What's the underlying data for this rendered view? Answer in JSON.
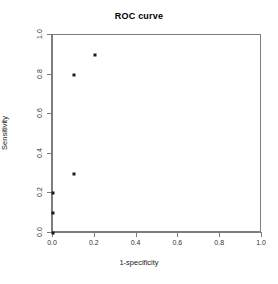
{
  "chart_data": {
    "type": "scatter",
    "title": "ROC curve",
    "xlabel": "1-specificity",
    "ylabel": "Sensitivity",
    "xlim": [
      0.0,
      1.0
    ],
    "ylim": [
      0.0,
      1.0
    ],
    "grid": false,
    "legend": null,
    "x_ticks": [
      "0.0",
      "0.2",
      "0.4",
      "0.6",
      "0.8",
      "1.0"
    ],
    "y_ticks": [
      "0.0",
      "0.2",
      "0.4",
      "0.6",
      "0.8",
      "1.0"
    ],
    "x_tick_values": [
      0.0,
      0.2,
      0.4,
      0.6,
      0.8,
      1.0
    ],
    "y_tick_values": [
      0.0,
      0.2,
      0.4,
      0.6,
      0.8,
      1.0
    ],
    "marker": "filled-square",
    "marker_color": "#1a1a1a",
    "points": [
      {
        "x": 0.0,
        "y": 0.0
      },
      {
        "x": 0.0,
        "y": 0.1
      },
      {
        "x": 0.0,
        "y": 0.2
      },
      {
        "x": 0.1,
        "y": 0.3
      },
      {
        "x": 0.1,
        "y": 0.8
      },
      {
        "x": 0.2,
        "y": 0.9
      }
    ],
    "x": [
      0.0,
      0.0,
      0.0,
      0.1,
      0.1,
      0.2
    ],
    "y": [
      0.0,
      0.1,
      0.2,
      0.3,
      0.8,
      0.9
    ]
  },
  "colors": {
    "background": "#ffffff",
    "axis": "#7d7d7d",
    "text": "#222222",
    "point": "#1a1a1a"
  }
}
